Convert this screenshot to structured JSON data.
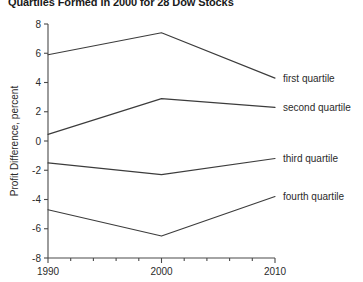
{
  "chart_data": {
    "type": "line",
    "title": "Quartiles Formed in 2000 for 28 Dow Stocks",
    "xlabel": "",
    "ylabel": "Profit Difference, percent",
    "x": [
      1990,
      2000,
      2010
    ],
    "xlim": [
      1990,
      2010
    ],
    "ylim": [
      -8,
      8
    ],
    "xticks": [
      1990,
      2000,
      2010
    ],
    "xtick_labels": [
      "1990",
      "2000",
      "2010"
    ],
    "x_minor_ticks": [
      1992,
      1994,
      1996,
      1998,
      2002,
      2004,
      2006,
      2008
    ],
    "yticks": [
      -8,
      -6,
      -4,
      -2,
      0,
      2,
      4,
      6,
      8
    ],
    "ytick_labels": [
      "-8",
      "-6",
      "-4",
      "-2",
      "0",
      "2",
      "4",
      "6",
      "8"
    ],
    "grid": false,
    "legend_position": "right-inline-labels",
    "line_color": "#3c3c3c",
    "series": [
      {
        "name": "first quartile",
        "values": [
          5.9,
          7.4,
          4.3
        ]
      },
      {
        "name": "second quartile",
        "values": [
          0.45,
          2.9,
          2.3
        ]
      },
      {
        "name": "third quartile",
        "values": [
          -1.5,
          -2.3,
          -1.2
        ]
      },
      {
        "name": "fourth quartile",
        "values": [
          -4.7,
          -6.5,
          -3.8
        ]
      }
    ]
  },
  "axes": {
    "y_title": "Profit Difference, percent"
  },
  "series_labels": [
    "first quartile",
    "second quartile",
    "third quartile",
    "fourth quartile"
  ]
}
